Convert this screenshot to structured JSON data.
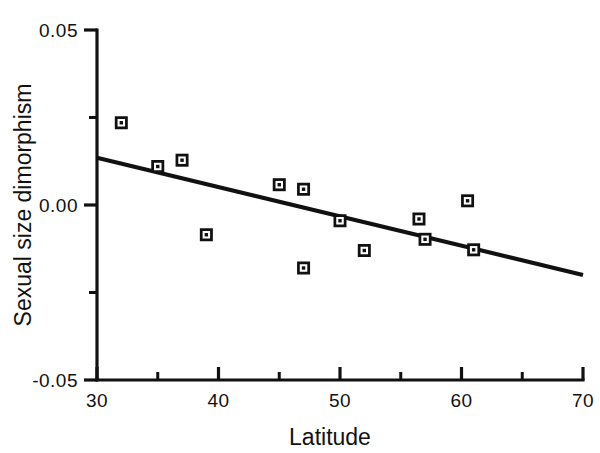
{
  "chart_data": {
    "type": "scatter",
    "title": "",
    "xlabel": "Latitude",
    "ylabel": "Sexual size dimorphism",
    "xlim": [
      30,
      70
    ],
    "ylim": [
      -0.05,
      0.05
    ],
    "grid": false,
    "legend": null,
    "x_ticks": [
      30,
      40,
      50,
      60,
      70
    ],
    "x_tick_labels": [
      "30",
      "40",
      "50",
      "60",
      "70"
    ],
    "x_minor_ticks": [
      35,
      45,
      55,
      65
    ],
    "y_ticks": [
      0.05,
      0.0,
      -0.05
    ],
    "y_tick_labels": [
      "0.05",
      "0.00",
      "-0.05"
    ],
    "y_minor_ticks": [
      0.025,
      -0.025
    ],
    "marker_style": "open-square-with-center-dot",
    "marker_color": "#111111",
    "points": [
      {
        "x": 32.0,
        "y": 0.0235
      },
      {
        "x": 35.0,
        "y": 0.011
      },
      {
        "x": 37.0,
        "y": 0.0128
      },
      {
        "x": 39.0,
        "y": -0.0085
      },
      {
        "x": 45.0,
        "y": 0.0058
      },
      {
        "x": 47.0,
        "y": 0.0045
      },
      {
        "x": 47.0,
        "y": -0.018
      },
      {
        "x": 50.0,
        "y": -0.0045
      },
      {
        "x": 52.0,
        "y": -0.013
      },
      {
        "x": 56.5,
        "y": -0.004
      },
      {
        "x": 57.0,
        "y": -0.0098
      },
      {
        "x": 60.5,
        "y": 0.0012
      },
      {
        "x": 61.0,
        "y": -0.0128
      }
    ],
    "fit_line": {
      "type": "linear-regression",
      "color": "#111111",
      "x_start": 30.0,
      "y_start": 0.0135,
      "x_end": 70.0,
      "y_end": -0.02
    }
  }
}
